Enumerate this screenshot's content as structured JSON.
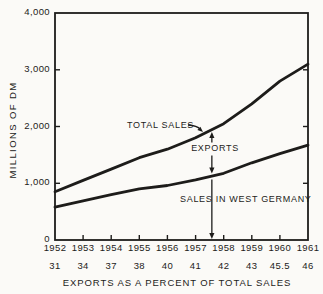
{
  "figure": {
    "background": "#fbfaf7",
    "ink": "#1d1c1a"
  },
  "chart_data": {
    "type": "line",
    "title": "",
    "ylabel": "MILLIONS OF DM",
    "xlabel": "EXPORTS AS A PERCENT OF TOTAL SALES",
    "x": [
      1952,
      1953,
      1954,
      1955,
      1956,
      1957,
      1958,
      1959,
      1960,
      1961
    ],
    "x_tick_labels": [
      "1952",
      "1953",
      "1954",
      "1955",
      "1956",
      "1957",
      "1958",
      "1959",
      "1960",
      "1961"
    ],
    "percent_row": [
      "31",
      "34",
      "37",
      "38",
      "40",
      "41",
      "42",
      "43",
      "45.5",
      "46"
    ],
    "ylim": [
      0,
      4000
    ],
    "y_ticks": [
      0,
      1000,
      2000,
      3000,
      4000
    ],
    "y_tick_labels": [
      "0",
      "1,000",
      "2,000",
      "3,000",
      "4,000"
    ],
    "grid": false,
    "legend": "inline-labels",
    "series": [
      {
        "name": "TOTAL SALES",
        "values": [
          850,
          1050,
          1250,
          1450,
          1600,
          1800,
          2050,
          2400,
          2800,
          3100
        ]
      },
      {
        "name": "SALES IN WEST GERMANY",
        "values": [
          580,
          690,
          800,
          900,
          960,
          1060,
          1175,
          1360,
          1520,
          1670
        ]
      }
    ],
    "annotations": {
      "total_sales_label": "TOTAL SALES",
      "exports_label": "EXPORTS",
      "domestic_label": "SALES IN WEST GERMANY",
      "arrow_year": 1957.58
    }
  }
}
